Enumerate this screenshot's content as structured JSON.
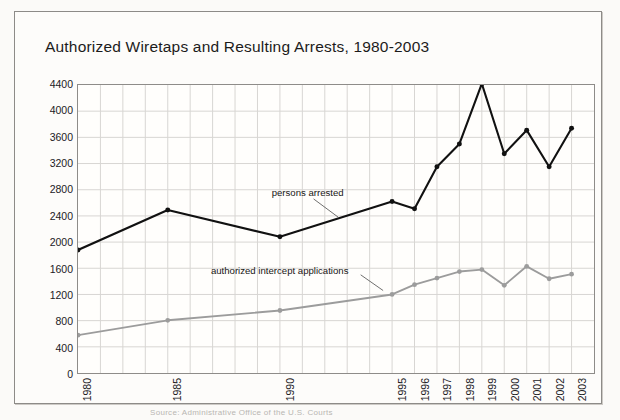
{
  "figure": {
    "title": "Authorized Wiretaps and Resulting Arrests, 1980-2003",
    "caption": "Source: Administrative Office of the U.S. Courts",
    "frame_color": "#8d8b88",
    "background": "#fdfcfa"
  },
  "annotations": {
    "arrested_label": "persons arrested",
    "applications_label": "authorized intercept applications"
  },
  "chart_data": {
    "type": "line",
    "title": "Authorized Wiretaps and Resulting Arrests, 1980-2003",
    "xlabel": "",
    "ylabel": "",
    "ylim": [
      0,
      4400
    ],
    "ytick_step": 400,
    "ytick_labels": [
      "4400",
      "4000",
      "3600",
      "3200",
      "2800",
      "2400",
      "2000",
      "1600",
      "1200",
      "800",
      "400",
      "0"
    ],
    "ytick_values": [
      4400,
      4000,
      3600,
      3200,
      2800,
      2400,
      2000,
      1600,
      1200,
      800,
      400,
      0
    ],
    "categories": [
      "1980",
      "1985",
      "1990",
      "1995",
      "1996",
      "1997",
      "1998",
      "1999",
      "2000",
      "2001",
      "2002",
      "2003"
    ],
    "x_positions": [
      0,
      4,
      9,
      14,
      15,
      16,
      17,
      18,
      19,
      20,
      21,
      22
    ],
    "x_domain": [
      0,
      23
    ],
    "grid": true,
    "grid_color": "#d8d6d3",
    "legend": "inline-annotations",
    "series": [
      {
        "name": "persons arrested",
        "color": "#111111",
        "marker": "circle",
        "values": [
          1880,
          2490,
          2080,
          2620,
          2510,
          3150,
          3500,
          4420,
          3350,
          3710,
          3150,
          3740
        ]
      },
      {
        "name": "authorized intercept applications",
        "color": "#9c9c9c",
        "marker": "circle",
        "values": [
          578,
          805,
          955,
          1200,
          1350,
          1450,
          1550,
          1580,
          1340,
          1630,
          1440,
          1510
        ]
      }
    ]
  }
}
